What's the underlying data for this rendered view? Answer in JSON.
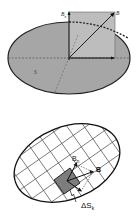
{
  "top_figure": {
    "labels": {
      "b_normal": "B",
      "b_normal_sub": "n",
      "b_vector": "B",
      "surface": "S"
    },
    "colors": {
      "ellipse_fill": "#a6a6a6",
      "rect_fill": "#bdbdbd",
      "stroke": "#222222"
    }
  },
  "bottom_figure": {
    "labels": {
      "b_normal": "B",
      "b_normal_sub": "n",
      "b_vector": "B",
      "area_element": "ΔS",
      "area_element_sub": "k"
    },
    "colors": {
      "ellipse_fill": "#ffffff",
      "grid_stroke": "#555555",
      "patch_fill": "#777777",
      "stroke": "#111111"
    }
  }
}
